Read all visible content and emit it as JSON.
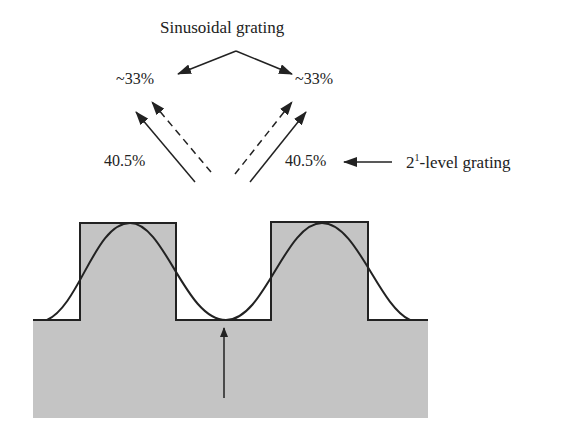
{
  "title": "Sinusoidal grating",
  "labels": {
    "left_diffraction_sine": "~33%",
    "right_diffraction_sine": "~33%",
    "left_diffraction_binary": "40.5%",
    "right_diffraction_binary": "40.5%",
    "binary_grating_base": "2",
    "binary_grating_exp": "1",
    "binary_grating_suffix": "-level grating"
  },
  "colors": {
    "substrate": "#c4c4c4",
    "line": "#222222"
  }
}
